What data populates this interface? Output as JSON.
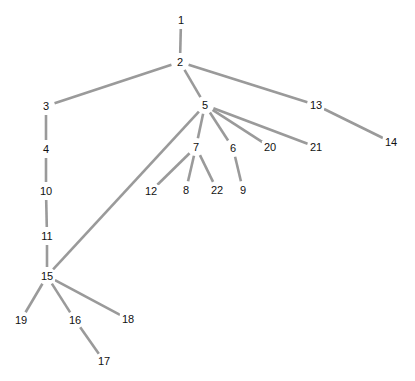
{
  "diagram": {
    "type": "tree",
    "edge_color": "#9a9a9a",
    "nodes": [
      {
        "id": "1",
        "label": "1",
        "x": 181,
        "y": 20
      },
      {
        "id": "2",
        "label": "2",
        "x": 180,
        "y": 62
      },
      {
        "id": "3",
        "label": "3",
        "x": 46,
        "y": 106
      },
      {
        "id": "4",
        "label": "4",
        "x": 46,
        "y": 149
      },
      {
        "id": "5",
        "label": "5",
        "x": 205,
        "y": 105
      },
      {
        "id": "6",
        "label": "6",
        "x": 233,
        "y": 148
      },
      {
        "id": "7",
        "label": "7",
        "x": 196,
        "y": 147
      },
      {
        "id": "8",
        "label": "8",
        "x": 186,
        "y": 190
      },
      {
        "id": "9",
        "label": "9",
        "x": 243,
        "y": 190
      },
      {
        "id": "10",
        "label": "10",
        "x": 46,
        "y": 191
      },
      {
        "id": "11",
        "label": "11",
        "x": 47,
        "y": 236
      },
      {
        "id": "12",
        "label": "12",
        "x": 151,
        "y": 191
      },
      {
        "id": "13",
        "label": "13",
        "x": 316,
        "y": 105
      },
      {
        "id": "14",
        "label": "14",
        "x": 391,
        "y": 142
      },
      {
        "id": "15",
        "label": "15",
        "x": 47,
        "y": 276
      },
      {
        "id": "16",
        "label": "16",
        "x": 75,
        "y": 320
      },
      {
        "id": "17",
        "label": "17",
        "x": 104,
        "y": 361
      },
      {
        "id": "18",
        "label": "18",
        "x": 128,
        "y": 319
      },
      {
        "id": "19",
        "label": "19",
        "x": 21,
        "y": 320
      },
      {
        "id": "20",
        "label": "20",
        "x": 270,
        "y": 147
      },
      {
        "id": "21",
        "label": "21",
        "x": 316,
        "y": 147
      },
      {
        "id": "22",
        "label": "22",
        "x": 217,
        "y": 190
      }
    ],
    "edges": [
      [
        "1",
        "2"
      ],
      [
        "2",
        "3"
      ],
      [
        "2",
        "5"
      ],
      [
        "2",
        "13"
      ],
      [
        "3",
        "4"
      ],
      [
        "4",
        "10"
      ],
      [
        "10",
        "11"
      ],
      [
        "11",
        "15"
      ],
      [
        "5",
        "15"
      ],
      [
        "5",
        "7"
      ],
      [
        "5",
        "6"
      ],
      [
        "5",
        "20"
      ],
      [
        "5",
        "21"
      ],
      [
        "13",
        "14"
      ],
      [
        "7",
        "12"
      ],
      [
        "7",
        "8"
      ],
      [
        "7",
        "22"
      ],
      [
        "6",
        "9"
      ],
      [
        "15",
        "19"
      ],
      [
        "15",
        "16"
      ],
      [
        "15",
        "18"
      ],
      [
        "16",
        "17"
      ]
    ]
  }
}
